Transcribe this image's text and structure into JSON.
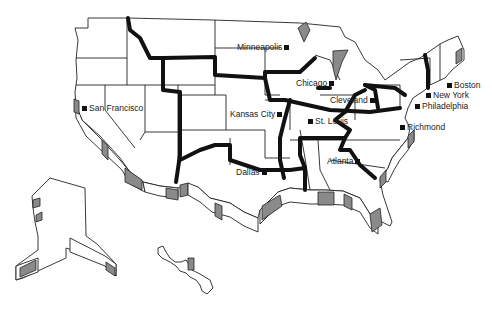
{
  "map": {
    "title": "United States regional map",
    "cities": [
      {
        "name": "Minneapolis",
        "x": 236,
        "y": 42,
        "marker": "right"
      },
      {
        "name": "Chicago",
        "x": 296,
        "y": 78,
        "marker": "right"
      },
      {
        "name": "San Francisco",
        "x": 82,
        "y": 103,
        "marker": "left"
      },
      {
        "name": "Kansas City",
        "x": 230,
        "y": 109,
        "marker": "right"
      },
      {
        "name": "St. Louis",
        "x": 308,
        "y": 117,
        "marker": "left"
      },
      {
        "name": "Cleveland",
        "x": 330,
        "y": 95,
        "marker": "right"
      },
      {
        "name": "Boston",
        "x": 447,
        "y": 81,
        "marker": "left"
      },
      {
        "name": "New York",
        "x": 426,
        "y": 91,
        "marker": "left"
      },
      {
        "name": "Philadelphia",
        "x": 415,
        "y": 102,
        "marker": "left"
      },
      {
        "name": "Richmond",
        "x": 400,
        "y": 123,
        "marker": "left"
      },
      {
        "name": "Atlanta",
        "x": 327,
        "y": 156,
        "marker": "right"
      },
      {
        "name": "Dallas",
        "x": 236,
        "y": 167,
        "marker": "right"
      }
    ]
  }
}
